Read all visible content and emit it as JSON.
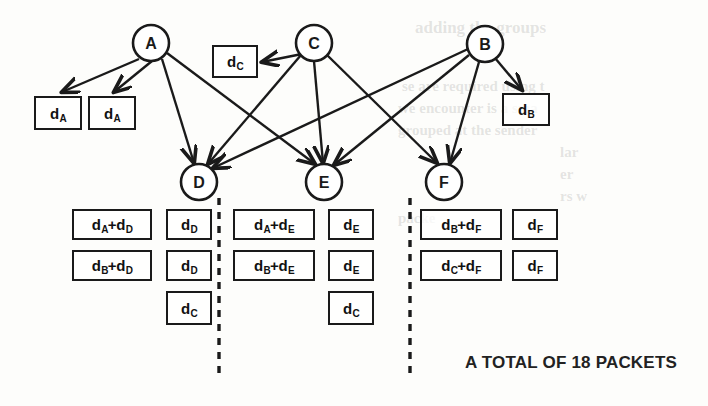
{
  "diagram": {
    "title": "A TOTAL OF 18 PACKETS",
    "nodes": [
      {
        "id": "A",
        "label": "A",
        "cx": 151,
        "cy": 43,
        "r": 18
      },
      {
        "id": "C",
        "label": "C",
        "cx": 314,
        "cy": 43,
        "r": 18
      },
      {
        "id": "B",
        "label": "B",
        "cx": 485,
        "cy": 44,
        "r": 18
      },
      {
        "id": "D",
        "label": "D",
        "cx": 199,
        "cy": 182,
        "r": 18
      },
      {
        "id": "E",
        "label": "E",
        "cx": 324,
        "cy": 182,
        "r": 18
      },
      {
        "id": "F",
        "label": "F",
        "cx": 444,
        "cy": 182,
        "r": 18
      }
    ],
    "edges": [
      {
        "from": "A",
        "to": "box-dA-1",
        "x1": 139,
        "y1": 59,
        "x2": 62,
        "y2": 92
      },
      {
        "from": "A",
        "to": "box-dA-2",
        "x1": 152,
        "y1": 61,
        "x2": 114,
        "y2": 92
      },
      {
        "from": "A",
        "to": "D",
        "x1": 162,
        "y1": 59,
        "x2": 194,
        "y2": 163
      },
      {
        "from": "A",
        "to": "E",
        "x1": 167,
        "y1": 53,
        "x2": 315,
        "y2": 164
      },
      {
        "from": "C",
        "to": "box-dC",
        "x1": 302,
        "y1": 54,
        "x2": 262,
        "y2": 62
      },
      {
        "from": "C",
        "to": "D",
        "x1": 301,
        "y1": 55,
        "x2": 208,
        "y2": 164
      },
      {
        "from": "C",
        "to": "E",
        "x1": 314,
        "y1": 61,
        "x2": 323,
        "y2": 163
      },
      {
        "from": "C",
        "to": "F",
        "x1": 327,
        "y1": 55,
        "x2": 437,
        "y2": 163
      },
      {
        "from": "B",
        "to": "box-dB",
        "x1": 495,
        "y1": 58,
        "x2": 522,
        "y2": 90
      },
      {
        "from": "B",
        "to": "D",
        "x1": 468,
        "y1": 49,
        "x2": 213,
        "y2": 168
      },
      {
        "from": "B",
        "to": "E",
        "x1": 469,
        "y1": 55,
        "x2": 334,
        "y2": 165
      },
      {
        "from": "B",
        "to": "F",
        "x1": 479,
        "y1": 62,
        "x2": 450,
        "y2": 163
      }
    ],
    "source_boxes": [
      {
        "name": "box-dA-1",
        "text": "d",
        "sub": "A",
        "x": 34,
        "y": 96,
        "w": 48,
        "h": 34
      },
      {
        "name": "box-dA-2",
        "text": "d",
        "sub": "A",
        "x": 88,
        "y": 96,
        "w": 48,
        "h": 34
      },
      {
        "name": "box-dC",
        "text": "d",
        "sub": "C",
        "x": 212,
        "y": 45,
        "w": 46,
        "h": 33
      },
      {
        "name": "box-dB",
        "text": "d",
        "sub": "B",
        "x": 502,
        "y": 93,
        "w": 48,
        "h": 33
      }
    ],
    "groups": [
      {
        "name": "group-d",
        "rows": [
          {
            "wide": "d_A+d_D",
            "narrow": "d_D"
          },
          {
            "wide": "d_B+d_D",
            "narrow": "d_D"
          },
          {
            "wide": "",
            "narrow": "d_C"
          }
        ]
      },
      {
        "name": "group-e",
        "rows": [
          {
            "wide": "d_A+d_E",
            "narrow": "d_E"
          },
          {
            "wide": "d_B+d_E",
            "narrow": "d_E"
          },
          {
            "wide": "",
            "narrow": "d_C"
          }
        ]
      },
      {
        "name": "group-f",
        "rows": [
          {
            "wide": "d_B+d_F",
            "narrow": "d_F"
          },
          {
            "wide": "d_C+d_F",
            "narrow": "d_F"
          }
        ]
      }
    ],
    "packet_boxes": [
      {
        "name": "packet-box",
        "base": "d",
        "sub": "A",
        "plus": true,
        "base2": "d",
        "sub2": "D",
        "x": 72,
        "y": 209,
        "w": 80,
        "h": 31
      },
      {
        "name": "packet-box",
        "base": "d",
        "sub": "D",
        "plus": false,
        "base2": "",
        "sub2": "",
        "x": 166,
        "y": 209,
        "w": 46,
        "h": 31
      },
      {
        "name": "packet-box",
        "base": "d",
        "sub": "B",
        "plus": true,
        "base2": "d",
        "sub2": "D",
        "x": 72,
        "y": 250,
        "w": 80,
        "h": 31
      },
      {
        "name": "packet-box",
        "base": "d",
        "sub": "D",
        "plus": false,
        "base2": "",
        "sub2": "",
        "x": 166,
        "y": 250,
        "w": 46,
        "h": 31
      },
      {
        "name": "packet-box",
        "base": "d",
        "sub": "C",
        "plus": false,
        "base2": "",
        "sub2": "",
        "x": 166,
        "y": 291,
        "w": 46,
        "h": 34
      },
      {
        "name": "packet-box",
        "base": "d",
        "sub": "A",
        "plus": true,
        "base2": "d",
        "sub2": "E",
        "x": 233,
        "y": 209,
        "w": 82,
        "h": 31
      },
      {
        "name": "packet-box",
        "base": "d",
        "sub": "E",
        "plus": false,
        "base2": "",
        "sub2": "",
        "x": 328,
        "y": 209,
        "w": 46,
        "h": 31
      },
      {
        "name": "packet-box",
        "base": "d",
        "sub": "B",
        "plus": true,
        "base2": "d",
        "sub2": "E",
        "x": 233,
        "y": 250,
        "w": 82,
        "h": 31
      },
      {
        "name": "packet-box",
        "base": "d",
        "sub": "E",
        "plus": false,
        "base2": "",
        "sub2": "",
        "x": 328,
        "y": 250,
        "w": 46,
        "h": 31
      },
      {
        "name": "packet-box",
        "base": "d",
        "sub": "C",
        "plus": false,
        "base2": "",
        "sub2": "",
        "x": 328,
        "y": 291,
        "w": 46,
        "h": 34
      },
      {
        "name": "packet-box",
        "base": "d",
        "sub": "B",
        "plus": true,
        "base2": "d",
        "sub2": "F",
        "x": 420,
        "y": 209,
        "w": 82,
        "h": 31
      },
      {
        "name": "packet-box",
        "base": "d",
        "sub": "F",
        "plus": false,
        "base2": "",
        "sub2": "",
        "x": 512,
        "y": 209,
        "w": 46,
        "h": 31
      },
      {
        "name": "packet-box",
        "base": "d",
        "sub": "C",
        "plus": true,
        "base2": "d",
        "sub2": "F",
        "x": 420,
        "y": 250,
        "w": 82,
        "h": 31
      },
      {
        "name": "packet-box",
        "base": "d",
        "sub": "F",
        "plus": false,
        "base2": "",
        "sub2": "",
        "x": 512,
        "y": 250,
        "w": 46,
        "h": 31
      }
    ],
    "separators": [
      {
        "name": "separator-left",
        "x": 219,
        "y1": 198,
        "y2": 375
      },
      {
        "name": "separator-right",
        "x": 410,
        "y1": 198,
        "y2": 375
      }
    ]
  },
  "background_text": [
    {
      "text": "adding the groups",
      "x": 415,
      "y": 18,
      "size": 17
    },
    {
      "text": "se are required using t",
      "x": 402,
      "y": 78,
      "size": 15
    },
    {
      "text": "we encounter is a sma",
      "x": 398,
      "y": 100,
      "size": 15
    },
    {
      "text": "grouped at the sender",
      "x": 398,
      "y": 122,
      "size": 15
    },
    {
      "text": "lar",
      "x": 560,
      "y": 144,
      "size": 15
    },
    {
      "text": "er",
      "x": 560,
      "y": 166,
      "size": 15
    },
    {
      "text": "rs w",
      "x": 560,
      "y": 188,
      "size": 15
    },
    {
      "text": "packe",
      "x": 398,
      "y": 210,
      "size": 15
    }
  ]
}
